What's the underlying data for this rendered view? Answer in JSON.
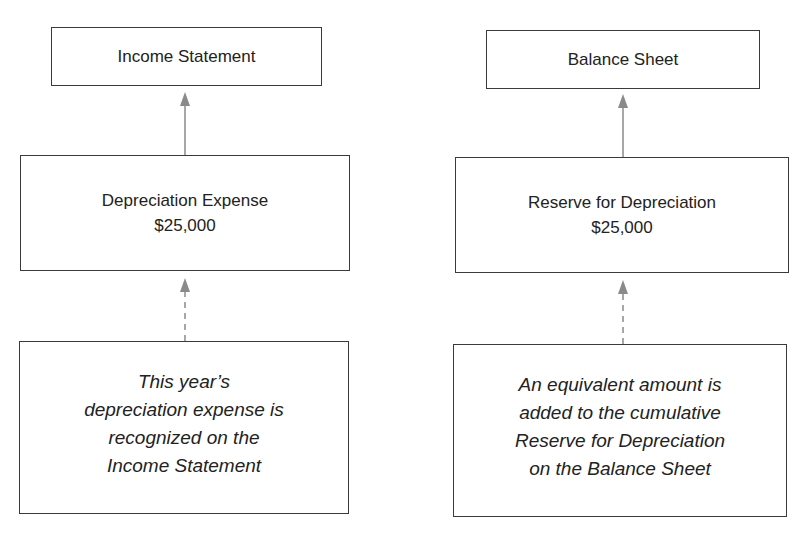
{
  "diagram": {
    "left_column": {
      "top_box": {
        "label": "Income Statement"
      },
      "middle_box": {
        "title": "Depreciation Expense",
        "amount": "$25,000"
      },
      "bottom_box": {
        "lines": [
          "This year’s",
          "depreciation expense is",
          "recognized on the",
          "Income Statement"
        ]
      }
    },
    "right_column": {
      "top_box": {
        "label": "Balance Sheet"
      },
      "middle_box": {
        "title": "Reserve for Depreciation",
        "amount": "$25,000"
      },
      "bottom_box": {
        "lines": [
          "An equivalent amount is",
          "added to the cumulative",
          "Reserve for Depreciation",
          "on the Balance Sheet"
        ]
      }
    },
    "colors": {
      "box_border": "#3a3a3a",
      "arrow": "#8a8a8a",
      "text": "#222222"
    },
    "connectors": [
      {
        "from": "Depreciation Expense",
        "to": "Income Statement",
        "style": "solid"
      },
      {
        "from": "This year's depreciation expense note",
        "to": "Depreciation Expense",
        "style": "dashed"
      },
      {
        "from": "Reserve for Depreciation",
        "to": "Balance Sheet",
        "style": "solid"
      },
      {
        "from": "Equivalent amount note",
        "to": "Reserve for Depreciation",
        "style": "dashed"
      }
    ]
  }
}
